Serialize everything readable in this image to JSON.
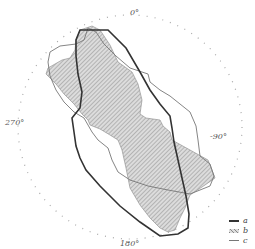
{
  "diagram": {
    "type": "polar-diagram",
    "angle_labels": {
      "top": "0°",
      "right": "-90°",
      "bottom": "180°",
      "left": "270°"
    },
    "legend": [
      {
        "key": "a",
        "style": "thick solid line"
      },
      {
        "key": "b",
        "style": "hatched fill"
      },
      {
        "key": "c",
        "style": "thin solid line"
      }
    ],
    "colors": {
      "line_a": "#333333",
      "hatch_b": "#9a9a9a",
      "fill_b": "#d9d9d9",
      "line_c": "#777777",
      "ticks": "#999999"
    }
  }
}
